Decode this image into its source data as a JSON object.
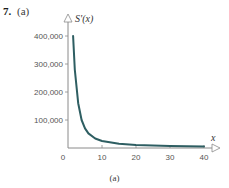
{
  "problem": {
    "number": "7.",
    "part": "(a)"
  },
  "caption": "(a)",
  "chart_data": {
    "type": "line",
    "title": "",
    "xlabel": "x",
    "ylabel": "S'(x)",
    "xlim": [
      0,
      42
    ],
    "ylim": [
      0,
      420000
    ],
    "x_ticks": [
      0,
      10,
      20,
      30,
      40
    ],
    "x_tick_labels": [
      "0",
      "10",
      "20",
      "30",
      "40"
    ],
    "y_ticks": [
      100000,
      200000,
      300000,
      400000
    ],
    "y_tick_labels": [
      "100,000",
      "200,000",
      "300,000",
      "400,000"
    ],
    "grid": false,
    "legend": null,
    "series": [
      {
        "name": "S'(x)",
        "color": "#2e5e62",
        "x": [
          1.5,
          2,
          3,
          4,
          5,
          6,
          8,
          10,
          15,
          20,
          25,
          30,
          35,
          40
        ],
        "y": [
          400000,
          280000,
          160000,
          100000,
          70000,
          52000,
          34000,
          25000,
          15000,
          11000,
          9000,
          7500,
          6500,
          5500
        ]
      }
    ]
  }
}
